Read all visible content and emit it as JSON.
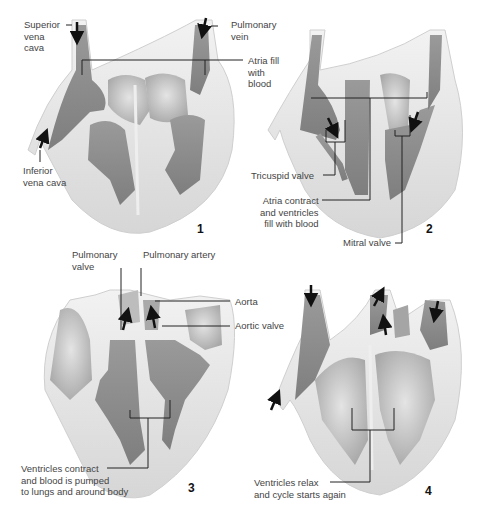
{
  "figure": {
    "panels": [
      {
        "number": "1",
        "labels": {
          "superior_vena_cava": [
            "Superior",
            "vena",
            "cava"
          ],
          "pulmonary_vein": [
            "Pulmonary",
            "vein"
          ],
          "atria_fill": [
            "Atria fill",
            "with",
            "blood"
          ],
          "inferior_vena_cava": [
            "Inferior",
            "vena cava"
          ]
        }
      },
      {
        "number": "2",
        "labels": {
          "tricuspid_valve": "Tricuspid valve",
          "atria_contract": [
            "Atria contract",
            "and ventricles",
            "fill with blood"
          ],
          "mitral_valve": "Mitral valve"
        }
      },
      {
        "number": "3",
        "labels": {
          "pulmonary_valve": [
            "Pulmonary",
            "valve"
          ],
          "pulmonary_artery": "Pulmonary artery",
          "aorta": "Aorta",
          "aortic_valve": "Aortic valve",
          "ventricles_contract": [
            "Ventricles contract",
            "and blood is  pumped",
            "to lungs and around body"
          ]
        }
      },
      {
        "number": "4",
        "labels": {
          "ventricles_relax": [
            "Ventricles relax",
            "and cycle starts again"
          ]
        }
      }
    ]
  },
  "colors": {
    "background": "#ffffff",
    "muscle": "#dcdcdc",
    "muscle_edge": "#c4c4c4",
    "blood_dark": "#8a8a8a",
    "blood_light": "#b9b9b9",
    "leader_line": "#222222",
    "arrow": "#111111"
  }
}
